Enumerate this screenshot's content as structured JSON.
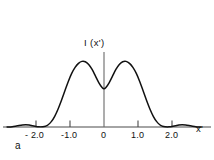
{
  "panel": {
    "label": "a"
  },
  "axes": {
    "y_label": "I (x')",
    "x_label": "x'"
  },
  "chart_data": {
    "type": "line",
    "title": "",
    "subtitle": "",
    "xlabel": "x'",
    "ylabel": "I (x')",
    "panel_label": "a",
    "grid": false,
    "legend": null,
    "line_color": "#111111",
    "axis_color": "#4a4a4a",
    "background_color": "#ffffff",
    "xlim": [
      -2.85,
      2.95
    ],
    "ylim": [
      0,
      1.12
    ],
    "xticks": [
      -2.0,
      -1.0,
      0,
      1.0,
      2.0
    ],
    "xtick_labels": [
      "- 2.0",
      "-1.0",
      "0",
      "1.0",
      "2.0"
    ],
    "yticks": [],
    "ytick_labels": [],
    "annotations": [
      "symmetric twin-peaked intensity profile",
      "central minimum at x' = 0 about half of peak height",
      "faint side lobes near x' = plus or minus 2.3"
    ],
    "series": [
      {
        "name": "I(x')",
        "x": [
          -2.85,
          -2.7,
          -2.55,
          -2.4,
          -2.3,
          -2.2,
          -2.1,
          -2.0,
          -1.9,
          -1.8,
          -1.72,
          -1.65,
          -1.55,
          -1.45,
          -1.35,
          -1.25,
          -1.15,
          -1.05,
          -0.95,
          -0.85,
          -0.75,
          -0.65,
          -0.55,
          -0.45,
          -0.35,
          -0.25,
          -0.15,
          -0.05,
          0.0,
          0.05,
          0.15,
          0.25,
          0.35,
          0.45,
          0.55,
          0.65,
          0.75,
          0.85,
          0.95,
          1.05,
          1.15,
          1.25,
          1.35,
          1.45,
          1.55,
          1.65,
          1.72,
          1.8,
          1.9,
          2.0,
          2.1,
          2.2,
          2.3,
          2.4,
          2.55,
          2.7,
          2.85
        ],
        "y": [
          0.0,
          0.005,
          0.018,
          0.03,
          0.034,
          0.03,
          0.018,
          0.006,
          0.002,
          0.004,
          0.012,
          0.03,
          0.08,
          0.16,
          0.27,
          0.4,
          0.54,
          0.68,
          0.8,
          0.89,
          0.95,
          0.98,
          0.975,
          0.935,
          0.86,
          0.76,
          0.66,
          0.585,
          0.57,
          0.585,
          0.66,
          0.76,
          0.86,
          0.935,
          0.975,
          0.98,
          0.95,
          0.89,
          0.8,
          0.68,
          0.54,
          0.4,
          0.27,
          0.16,
          0.08,
          0.03,
          0.012,
          0.004,
          0.002,
          0.006,
          0.018,
          0.03,
          0.034,
          0.03,
          0.018,
          0.005,
          0.0
        ]
      }
    ],
    "peaks": [
      {
        "x": -0.65,
        "y": 0.98
      },
      {
        "x": 0.65,
        "y": 0.98
      }
    ],
    "minima": [
      {
        "x": 0.0,
        "y": 0.57
      }
    ]
  }
}
